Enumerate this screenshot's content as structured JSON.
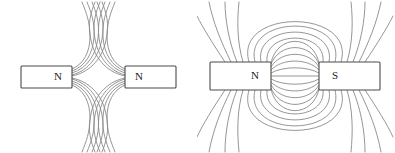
{
  "figure": {
    "background_color": "#ffffff",
    "line_color": "#8a8a8a",
    "magnet_stroke_color": "#4a4a4a",
    "magnet_fill_color": "#ffffff",
    "label_color": "#222222",
    "width": 395,
    "height": 153
  },
  "diagrams": [
    {
      "id": "repulsion",
      "name": "like-poles-repulsion",
      "caption": "",
      "interaction": "repulsion",
      "magnets": [
        {
          "label": "N",
          "side": "left",
          "pole_facing": "N",
          "x": 21,
          "y": 66,
          "width": 51,
          "height": 22,
          "label_x": 58,
          "label_y": 77
        },
        {
          "label": "N",
          "side": "right",
          "pole_facing": "N",
          "x": 125,
          "y": 66,
          "width": 51,
          "height": 22,
          "label_x": 139,
          "label_y": 77
        }
      ],
      "field_line_count_per_side": 5,
      "symmetry": "mirror-horizontal-and-vertical"
    },
    {
      "id": "attraction",
      "name": "unlike-poles-attraction",
      "caption": "",
      "interaction": "attraction",
      "magnets": [
        {
          "label": "N",
          "side": "left",
          "pole_facing": "N",
          "x": 13,
          "y": 62,
          "width": 61,
          "height": 28,
          "label_x": 58,
          "label_y": 76
        },
        {
          "label": "S",
          "side": "right",
          "pole_facing": "S",
          "x": 122,
          "y": 62,
          "width": 61,
          "height": 28,
          "label_x": 138,
          "label_y": 76
        }
      ],
      "inner_arc_count": 9,
      "outer_line_count_per_quadrant": 6,
      "symmetry": "mirror-horizontal-and-vertical"
    }
  ]
}
